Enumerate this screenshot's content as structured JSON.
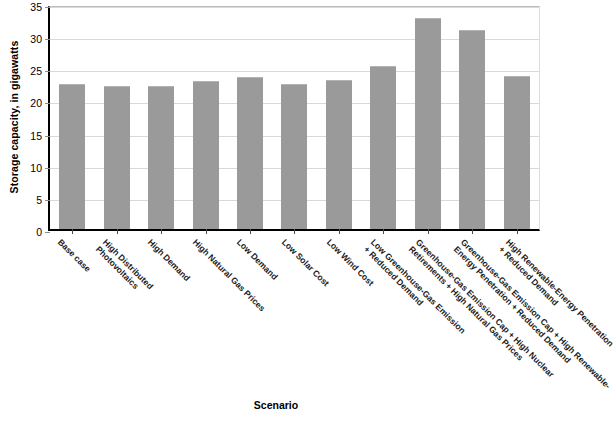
{
  "chart_data": {
    "type": "bar",
    "title": "",
    "xlabel": "Scenario",
    "ylabel": "Storage capacity, in gigawatts",
    "ylim": [
      0,
      35
    ],
    "ytick_step": 5,
    "yticks": [
      "0",
      "5",
      "10",
      "15",
      "20",
      "25",
      "30",
      "35"
    ],
    "grid": true,
    "legend": "none",
    "bar_color": "#9a9a9a",
    "categories": [
      "Base case",
      "High Distributed Photovoltaics",
      "High Demand",
      "High Natural Gas Prices",
      "Low Demand",
      "Low Solar Cost",
      "Low Wind Cost",
      "Low Greenhouse-Gas Emission + Reduced Demand",
      "Greenhouse-Gas Emission Cap + High Nuclear Retirements + High Natural Gas Prices",
      "Greenhouse-Gas Emission Cap + High Renewable-Energy Penetration + Reduced Demand",
      "High Renewable-Energy Penetration + Reduced Demand"
    ],
    "category_lines": [
      [
        "Base case",
        ""
      ],
      [
        "High Distributed",
        "Photovoltaics"
      ],
      [
        "High Demand",
        ""
      ],
      [
        "High Natural Gas Prices",
        ""
      ],
      [
        "Low Demand",
        ""
      ],
      [
        "Low Solar Cost",
        ""
      ],
      [
        "Low Wind Cost",
        ""
      ],
      [
        "Low Greenhouse-Gas Emission",
        "+ Reduced Demand"
      ],
      [
        "Greenhouse-Gas Emission Cap + High Nuclear",
        "Retirements + High Natural Gas Prices"
      ],
      [
        "Greenhouse-Gas Emission Cap + High Renewable-",
        "Energy Penetration + Reduced Demand"
      ],
      [
        "High Renewable-Energy Penetration",
        "+ Reduced Demand"
      ]
    ],
    "values": [
      22.5,
      22.3,
      22.3,
      23.0,
      23.7,
      22.6,
      23.2,
      25.4,
      32.8,
      31.0,
      23.8
    ]
  },
  "caption": ""
}
